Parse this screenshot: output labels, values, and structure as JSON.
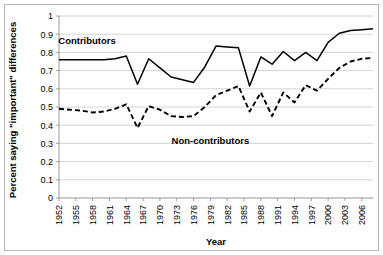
{
  "chart_data": {
    "type": "line",
    "title": "",
    "xlabel": "Year",
    "ylabel": "Percent saying \"important\" differences",
    "xlim": [
      1952,
      2008
    ],
    "ylim": [
      0,
      1
    ],
    "ytick_step": 0.1,
    "xtick_step": 3,
    "grid": "horizontal",
    "legend_position": "inline-annotations",
    "yticks": [
      "0",
      "0.1",
      "0.2",
      "0.3",
      "0.4",
      "0.5",
      "0.6",
      "0.7",
      "0.8",
      "0.9",
      "1"
    ],
    "xticks": [
      "1952",
      "1955",
      "1958",
      "1961",
      "1964",
      "1967",
      "1970",
      "1973",
      "1976",
      "1979",
      "1982",
      "1985",
      "1988",
      "1991",
      "1994",
      "1997",
      "2000",
      "2003",
      "2006"
    ],
    "x": [
      1952,
      1954,
      1956,
      1958,
      1960,
      1962,
      1964,
      1966,
      1968,
      1970,
      1972,
      1974,
      1976,
      1978,
      1980,
      1982,
      1984,
      1986,
      1988,
      1990,
      1992,
      1994,
      1996,
      1998,
      2000,
      2002,
      2004,
      2006,
      2008
    ],
    "series": [
      {
        "name": "Contributors",
        "style": "solid",
        "color": "#000000",
        "label_text": "Contributors",
        "values": [
          0.76,
          0.76,
          0.76,
          0.76,
          0.76,
          0.765,
          0.78,
          0.625,
          0.765,
          0.715,
          0.665,
          0.65,
          0.635,
          0.72,
          0.835,
          0.83,
          0.825,
          0.615,
          0.775,
          0.735,
          0.805,
          0.755,
          0.8,
          0.755,
          0.855,
          0.905,
          0.92,
          0.925,
          0.93
        ]
      },
      {
        "name": "Non-contributors",
        "style": "dashed",
        "color": "#000000",
        "label_text": "Non-contributors",
        "values": [
          0.49,
          0.485,
          0.48,
          0.47,
          0.475,
          0.49,
          0.515,
          0.385,
          0.505,
          0.485,
          0.45,
          0.445,
          0.45,
          0.5,
          0.565,
          0.59,
          0.615,
          0.475,
          0.58,
          0.45,
          0.58,
          0.525,
          0.62,
          0.59,
          0.655,
          0.715,
          0.75,
          0.765,
          0.77
        ]
      }
    ],
    "annotations": [
      {
        "name": "contributors-label",
        "text": "Contributors",
        "x": 1957,
        "y": 0.845
      },
      {
        "name": "non-contributors-label",
        "text": "Non-contributors",
        "x": 1979,
        "y": 0.295
      }
    ]
  }
}
